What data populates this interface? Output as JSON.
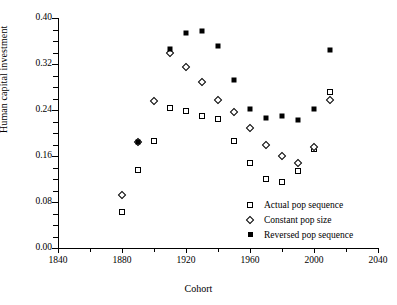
{
  "chart_data": {
    "type": "scatter",
    "title": "",
    "xlabel": "Cohort",
    "ylabel": "Human capital investment",
    "xlim": [
      1840,
      2040
    ],
    "ylim": [
      0.0,
      0.4
    ],
    "xticks": [
      1840,
      1880,
      1920,
      1960,
      2000,
      2040
    ],
    "xtick_labels": [
      "1840",
      "1880",
      "1920",
      "1960",
      "2000",
      "2040"
    ],
    "xminor_step": 20,
    "yticks": [
      0.0,
      0.08,
      0.16,
      0.24,
      0.32,
      0.4
    ],
    "ytick_labels": [
      "0.00",
      "0.08",
      "0.16",
      "0.24",
      "0.32",
      "0.40"
    ],
    "yminor_step": 0.02,
    "grid": false,
    "legend_position": "lower right",
    "series": [
      {
        "name": "Actual pop sequence",
        "marker": "open-square",
        "x": [
          1880,
          1890,
          1900,
          1910,
          1920,
          1930,
          1940,
          1950,
          1960,
          1970,
          1980,
          1990,
          2000,
          2010
        ],
        "y": [
          0.062,
          0.136,
          0.186,
          0.243,
          0.238,
          0.229,
          0.224,
          0.186,
          0.148,
          0.12,
          0.115,
          0.134,
          0.172,
          0.272
        ]
      },
      {
        "name": "Constant pop size",
        "marker": "open-diamond",
        "x": [
          1880,
          1890,
          1900,
          1910,
          1920,
          1930,
          1940,
          1950,
          1960,
          1970,
          1980,
          1990,
          2000,
          2010
        ],
        "y": [
          0.092,
          0.185,
          0.256,
          0.339,
          0.315,
          0.288,
          0.258,
          0.236,
          0.209,
          0.18,
          0.16,
          0.148,
          0.175,
          0.258
        ]
      },
      {
        "name": "Reversed pop sequence",
        "marker": "filled-square",
        "x": [
          1890,
          1910,
          1920,
          1930,
          1940,
          1950,
          1960,
          1970,
          1980,
          1990,
          2000,
          2010
        ],
        "y": [
          0.184,
          0.346,
          0.374,
          0.377,
          0.352,
          0.292,
          0.241,
          0.226,
          0.229,
          0.223,
          0.242,
          0.344
        ]
      }
    ]
  },
  "legend": {
    "items": [
      {
        "label": "Actual pop sequence",
        "marker": "open-square"
      },
      {
        "label": "Constant pop size",
        "marker": "open-diamond"
      },
      {
        "label": "Reversed pop sequence",
        "marker": "filled-square"
      }
    ]
  }
}
